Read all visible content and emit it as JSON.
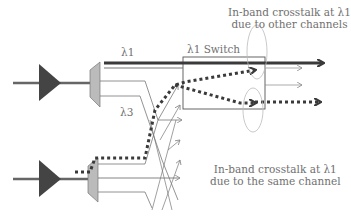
{
  "diagram": {
    "labels": {
      "lambda1": "λ1",
      "lambda3": "λ3",
      "switch": "λ1 Switch",
      "top_annotation_line1": "In-band crosstalk at λ1",
      "top_annotation_line2": "due to other channels",
      "bottom_annotation_line1": "In-band crosstalk at λ1",
      "bottom_annotation_line2": "due to the same channel"
    },
    "colors": {
      "amplifier": "#444444",
      "demux": "#bbbbbb",
      "signal_path": "#3a3a3a",
      "thin_lines": "#777777",
      "text": "#707070"
    },
    "components": [
      "amplifier-top",
      "amplifier-bottom",
      "demux-top",
      "demux-bottom",
      "lambda1-switch"
    ]
  }
}
